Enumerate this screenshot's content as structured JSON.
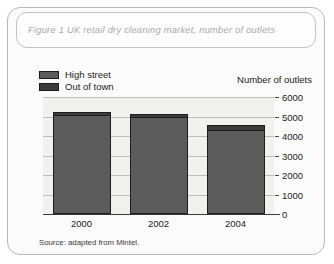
{
  "figure": {
    "title": "Figure 1 UK retail dry cleaning market, number of outlets",
    "source_note": "Source: adapted from Mintel.",
    "border_color": "#b9b9bb",
    "title_color": "#a9a9ae",
    "plot_background": "#f1f1ef"
  },
  "chart_data": {
    "type": "bar",
    "subtype": "stacked",
    "title": "Figure 1 UK retail dry cleaning market, number of outlets",
    "xlabel": "",
    "ylabel": "Number of outlets",
    "categories": [
      "2000",
      "2002",
      "2004"
    ],
    "series": [
      {
        "name": "High street",
        "color": "#5c5c5c",
        "values": [
          5100,
          4950,
          4300
        ]
      },
      {
        "name": "Out of town",
        "color": "#3b3b3b",
        "values": [
          150,
          200,
          250
        ]
      }
    ],
    "totals": [
      5250,
      5150,
      4550
    ],
    "ylim": [
      0,
      6000
    ],
    "yticks": [
      0,
      1000,
      2000,
      3000,
      4000,
      5000,
      6000
    ],
    "ytick_labels": [
      "0",
      "1000",
      "2000",
      "3000",
      "4000",
      "5000",
      "6000"
    ],
    "grid": true,
    "legend_position": "top-left"
  },
  "legend": {
    "items": [
      {
        "label": "High street",
        "color": "#5c5c5c"
      },
      {
        "label": "Out of town",
        "color": "#3b3b3b"
      }
    ]
  },
  "axis": {
    "y_title": "Number of outlets"
  }
}
